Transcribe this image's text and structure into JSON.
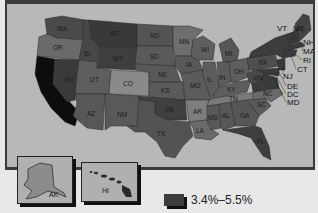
{
  "map": {
    "type": "choropleth",
    "region": "United States",
    "colors": {
      "background": "#b8b8b8",
      "frame": "#3a3a3a",
      "page": "#e8e8e8",
      "legend_swatch": "#3c3c3c"
    },
    "states": [
      {
        "abbr": "WA",
        "shade": "#4a4a4a"
      },
      {
        "abbr": "OR",
        "shade": "#6a6a6a"
      },
      {
        "abbr": "CA",
        "shade": "#0d0d0d"
      },
      {
        "abbr": "NV",
        "shade": "#3a3a3a"
      },
      {
        "abbr": "ID",
        "shade": "#474747"
      },
      {
        "abbr": "MT",
        "shade": "#393939"
      },
      {
        "abbr": "WY",
        "shade": "#3e3e3e"
      },
      {
        "abbr": "UT",
        "shade": "#5e5e5e"
      },
      {
        "abbr": "CO",
        "shade": "#8a8a8a"
      },
      {
        "abbr": "AZ",
        "shade": "#575757"
      },
      {
        "abbr": "NM",
        "shade": "#595959"
      },
      {
        "abbr": "ND",
        "shade": "#545454"
      },
      {
        "abbr": "SD",
        "shade": "#5a5a5a"
      },
      {
        "abbr": "NE",
        "shade": "#585858"
      },
      {
        "abbr": "KS",
        "shade": "#5a5a5a"
      },
      {
        "abbr": "OK",
        "shade": "#404040"
      },
      {
        "abbr": "TX",
        "shade": "#535353"
      },
      {
        "abbr": "MN",
        "shade": "#6e6e6e"
      },
      {
        "abbr": "IA",
        "shade": "#595959"
      },
      {
        "abbr": "MO",
        "shade": "#5b5b5b"
      },
      {
        "abbr": "AR",
        "shade": "#7e7e7e"
      },
      {
        "abbr": "LA",
        "shade": "#6a6a6a"
      },
      {
        "abbr": "WI",
        "shade": "#5f5f5f"
      },
      {
        "abbr": "IL",
        "shade": "#5c5c5c"
      },
      {
        "abbr": "MI",
        "shade": "#575757"
      },
      {
        "abbr": "IN",
        "shade": "#5c5c5c"
      },
      {
        "abbr": "OH",
        "shade": "#5e5e5e"
      },
      {
        "abbr": "KY",
        "shade": "#5e5e5e"
      },
      {
        "abbr": "TN",
        "shade": "#7a7a7a"
      },
      {
        "abbr": "MS",
        "shade": "#585858"
      },
      {
        "abbr": "AL",
        "shade": "#575757"
      },
      {
        "abbr": "GA",
        "shade": "#565656"
      },
      {
        "abbr": "FL",
        "shade": "#3e3e3e"
      },
      {
        "abbr": "SC",
        "shade": "#5a5a5a"
      },
      {
        "abbr": "NC",
        "shade": "#6a6a6a"
      },
      {
        "abbr": "VA",
        "shade": "#3b3b3b"
      },
      {
        "abbr": "WV",
        "shade": "#4a4a4a"
      },
      {
        "abbr": "PA",
        "shade": "#4e4e4e"
      },
      {
        "abbr": "NY",
        "shade": "#3c3c3c"
      },
      {
        "abbr": "VT",
        "shade": "#3a3a3a"
      },
      {
        "abbr": "ME",
        "shade": "#444444"
      },
      {
        "abbr": "NH",
        "shade": "#3a3a3a"
      },
      {
        "abbr": "MA",
        "shade": "#3a3a3a"
      },
      {
        "abbr": "RI",
        "shade": "#3a3a3a"
      },
      {
        "abbr": "CT",
        "shade": "#3a3a3a"
      },
      {
        "abbr": "NJ",
        "shade": "#3a3a3a"
      },
      {
        "abbr": "DE",
        "shade": "#3a3a3a"
      },
      {
        "abbr": "DC",
        "shade": "#3a3a3a"
      },
      {
        "abbr": "MD",
        "shade": "#3a3a3a"
      },
      {
        "abbr": "AK",
        "shade": "#8c8c8c"
      },
      {
        "abbr": "HI",
        "shade": "#2a2a2a"
      }
    ],
    "labels": {
      "WA": "WA",
      "OR": "OR",
      "CA": "CA",
      "NV": "NV",
      "ID": "ID",
      "MT": "MT",
      "WY": "WY",
      "UT": "UT",
      "CO": "CO",
      "AZ": "AZ",
      "NM": "NM",
      "ND": "ND",
      "SD": "SD",
      "NE": "NE",
      "KS": "KS",
      "OK": "OK",
      "TX": "TX",
      "MN": "MN",
      "IA": "IA",
      "MO": "MO",
      "AR": "AR",
      "LA": "LA",
      "WI": "WI",
      "IL": "IL",
      "MI": "MI",
      "IN": "IN",
      "OH": "OH",
      "KY": "KY",
      "TN": "TN",
      "MS": "MS",
      "AL": "AL",
      "GA": "GA",
      "FL": "FL",
      "SC": "SC",
      "NC": "NC",
      "VA": "VA",
      "WV": "WV",
      "PA": "PA",
      "NY": "NY",
      "VT": "VT",
      "ME": "ME",
      "NH": "NH",
      "MA": "MA",
      "RI": "RI",
      "CT": "CT",
      "NJ": "NJ",
      "DE": "DE",
      "DC": "DC",
      "MD": "MD",
      "AK": "AK",
      "HI": "HI"
    },
    "insets": [
      {
        "name": "Alaska",
        "label": "AK"
      },
      {
        "name": "Hawaii",
        "label": "HI"
      }
    ]
  },
  "legend": {
    "items": [
      {
        "label": "3.4%–5.5%",
        "color": "#3c3c3c"
      }
    ]
  }
}
